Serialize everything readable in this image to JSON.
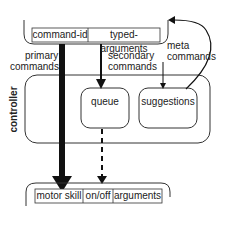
{
  "top_box": {
    "fields": [
      "command-id",
      "typed-arguments"
    ]
  },
  "labels": {
    "primary": "primary\ncommands",
    "primary_line1": "primary",
    "primary_line2": "commands",
    "secondary_line1": "secondary",
    "secondary_line2": "commands",
    "meta_line1": "meta",
    "meta_line2": "commands"
  },
  "controller": {
    "label": "controller",
    "queue": "queue",
    "suggestions": "suggestions"
  },
  "bottom_box": {
    "fields": [
      "motor skill",
      "on/off",
      "arguments"
    ]
  }
}
